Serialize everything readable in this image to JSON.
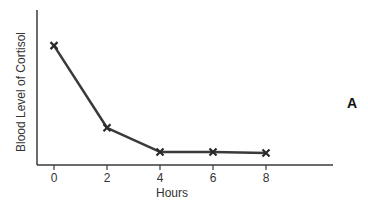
{
  "chart_data": {
    "type": "line",
    "title": "",
    "xlabel": "Hours",
    "ylabel": "Blood Level of Cortisol",
    "panel_label": "A",
    "x": [
      0,
      2,
      4,
      6,
      8
    ],
    "x_tick_labels": [
      "0",
      "2",
      "4",
      "6",
      "8"
    ],
    "y_tick_labels": [],
    "series": [
      {
        "name": "Blood Level of Cortisol",
        "values": [
          77,
          24,
          8.4,
          8.4,
          7.7
        ],
        "marker": "x",
        "color": "#3a3a3a"
      }
    ],
    "xlim": [
      -0.6,
      10.6
    ],
    "ylim": [
      0,
      100
    ],
    "grid": false,
    "legend": "none"
  },
  "colors": {
    "axis": "#3a3a3a",
    "line": "#3a3a3a",
    "text": "#333333",
    "background": "#ffffff"
  }
}
